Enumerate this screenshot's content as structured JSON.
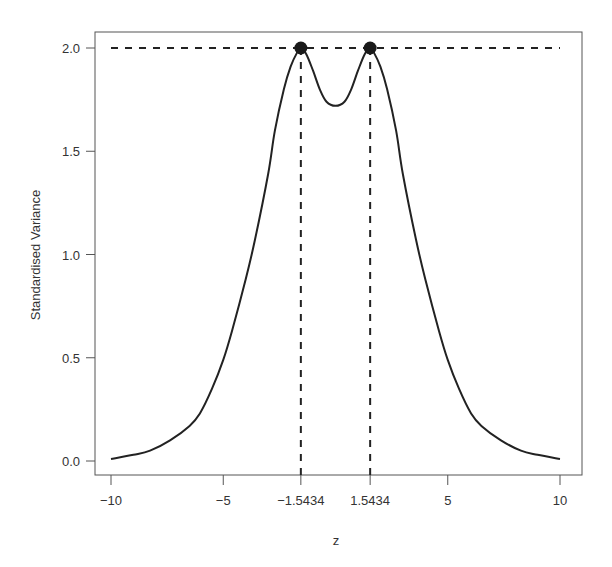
{
  "chart_data": {
    "type": "line",
    "title": "",
    "xlabel": "z",
    "ylabel": "Standardised Variance",
    "xlim": [
      -10.7,
      11.3
    ],
    "ylim": [
      -0.07,
      2.07
    ],
    "x_ticks": [
      -10,
      -5,
      -1.5434,
      1.5434,
      5,
      10
    ],
    "x_tick_labels": [
      "−10",
      "−5",
      "−1.5434",
      "1.5434",
      "5",
      "10"
    ],
    "y_ticks": [
      0.0,
      0.5,
      1.0,
      1.5,
      2.0
    ],
    "y_tick_labels": [
      "0.0",
      "0.5",
      "1.0",
      "1.5",
      "2.0"
    ],
    "grid": false,
    "legend": null,
    "series": [
      {
        "name": "standardised variance",
        "style": "solid",
        "color": "#222222",
        "x": [
          -10,
          -9,
          -8.26,
          -7.37,
          -6.5,
          -6.04,
          -5.5,
          -5.0,
          -4.61,
          -4.0,
          -3.59,
          -3.0,
          -2.7,
          -2.3,
          -2.0,
          -1.7,
          -1.5434,
          -1.3,
          -1.0,
          -0.7,
          -0.4,
          0,
          0.4,
          0.7,
          1.0,
          1.3,
          1.5434,
          1.7,
          2.0,
          2.3,
          2.7,
          3.0,
          3.59,
          4.0,
          4.61,
          5.0,
          5.5,
          6.04,
          6.5,
          7.37,
          8.26,
          9,
          10
        ],
        "y": [
          0.01,
          0.03,
          0.05,
          0.1,
          0.17,
          0.23,
          0.35,
          0.49,
          0.63,
          0.88,
          1.07,
          1.39,
          1.6,
          1.8,
          1.91,
          1.98,
          2.0,
          1.97,
          1.89,
          1.8,
          1.74,
          1.72,
          1.74,
          1.8,
          1.89,
          1.97,
          2.0,
          1.98,
          1.91,
          1.8,
          1.6,
          1.39,
          1.07,
          0.88,
          0.63,
          0.49,
          0.35,
          0.23,
          0.17,
          0.1,
          0.05,
          0.03,
          0.01
        ]
      }
    ],
    "reference_lines": [
      {
        "orientation": "horizontal",
        "y": 2.0,
        "x_from": -10,
        "x_to": 10,
        "style": "dashed"
      },
      {
        "orientation": "vertical",
        "x": -1.5434,
        "y_from": 0,
        "y_to": 2.0,
        "style": "dashed"
      },
      {
        "orientation": "vertical",
        "x": 1.5434,
        "y_from": 0,
        "y_to": 2.0,
        "style": "dashed"
      }
    ],
    "points": [
      {
        "x": -1.5434,
        "y": 2.0,
        "label": "maximum"
      },
      {
        "x": 1.5434,
        "y": 2.0,
        "label": "maximum"
      }
    ]
  },
  "colors": {
    "line": "#222222",
    "axis": "#555555",
    "text": "#333333",
    "background": "#ffffff"
  }
}
